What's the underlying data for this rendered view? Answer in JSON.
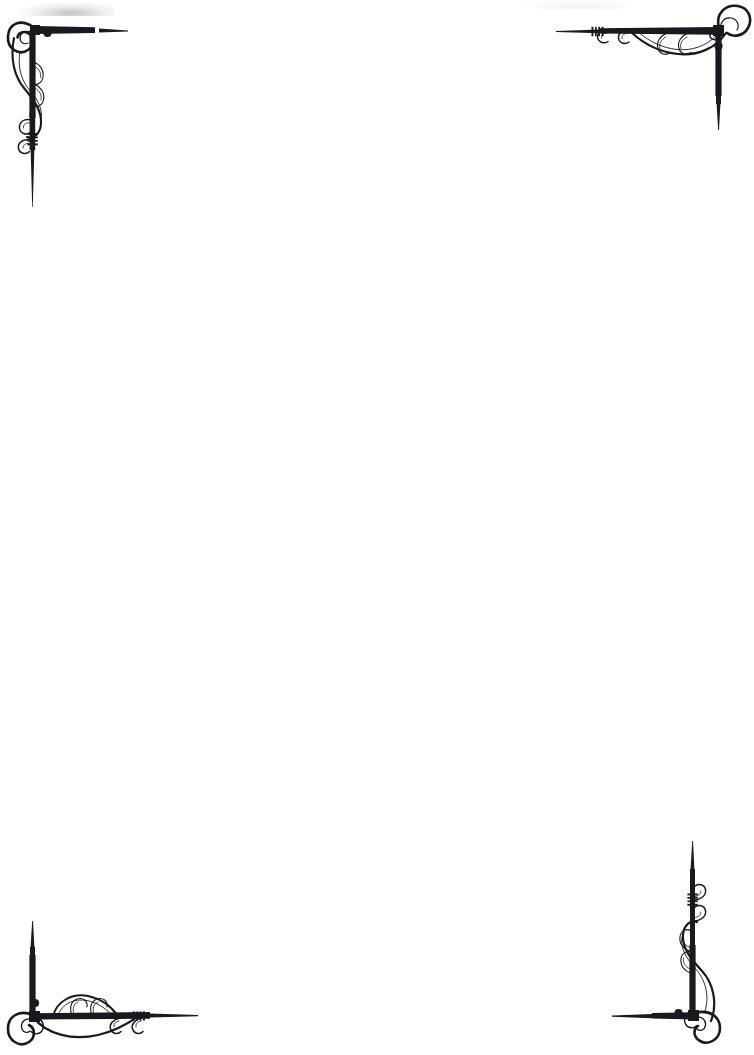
{
  "page": {
    "document_type": "blank-bordered-page",
    "width_px": 754,
    "height_px": 1055,
    "background_color": "#ffffff",
    "ink_color": "#191920",
    "ink_color_soft": "#2b2b33",
    "body_text": "",
    "orientation": "portrait"
  },
  "ornaments": [
    {
      "id": "top-left",
      "name": "Top Left Corner Flourish",
      "position": "top-left",
      "corner_dot": true,
      "has_hatch_band": true,
      "rule_directions": [
        "right",
        "down"
      ]
    },
    {
      "id": "top-right",
      "name": "Top Right Corner Flourish",
      "position": "top-right",
      "corner_dot": true,
      "has_hatch_band": true,
      "rule_directions": [
        "left",
        "down"
      ]
    },
    {
      "id": "bottom-left",
      "name": "Bottom Left Corner Flourish",
      "position": "bottom-left",
      "corner_dot": true,
      "has_hatch_band": true,
      "rule_directions": [
        "right",
        "up"
      ]
    },
    {
      "id": "bottom-right",
      "name": "Bottom Right Corner Flourish",
      "position": "bottom-right",
      "corner_dot": true,
      "has_hatch_band": true,
      "rule_directions": [
        "left",
        "up"
      ]
    }
  ]
}
